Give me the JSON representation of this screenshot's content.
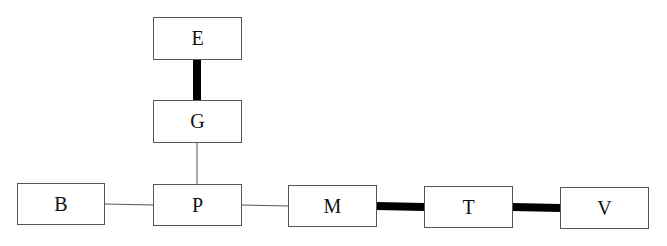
{
  "diagram": {
    "type": "tree",
    "nodes": [
      {
        "id": "E",
        "label": "E",
        "x": 153,
        "y": 17,
        "w": 89,
        "h": 43
      },
      {
        "id": "G",
        "label": "G",
        "x": 153,
        "y": 100,
        "w": 89,
        "h": 43
      },
      {
        "id": "B",
        "label": "B",
        "x": 17,
        "y": 183,
        "w": 88,
        "h": 42
      },
      {
        "id": "P",
        "label": "P",
        "x": 153,
        "y": 184,
        "w": 89,
        "h": 42
      },
      {
        "id": "M",
        "label": "M",
        "x": 288,
        "y": 185,
        "w": 89,
        "h": 42
      },
      {
        "id": "T",
        "label": "T",
        "x": 424,
        "y": 186,
        "w": 89,
        "h": 42
      },
      {
        "id": "V",
        "label": "V",
        "x": 560,
        "y": 187,
        "w": 89,
        "h": 42
      }
    ],
    "edges": [
      {
        "from": "E",
        "to": "G",
        "weight": "thick"
      },
      {
        "from": "G",
        "to": "P",
        "weight": "thin"
      },
      {
        "from": "B",
        "to": "P",
        "weight": "thin"
      },
      {
        "from": "P",
        "to": "M",
        "weight": "thin"
      },
      {
        "from": "M",
        "to": "T",
        "weight": "thick"
      },
      {
        "from": "T",
        "to": "V",
        "weight": "thick"
      }
    ]
  }
}
